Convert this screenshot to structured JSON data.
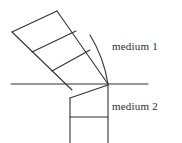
{
  "figure": {
    "kind": "physics-wavefront-refraction-diagram",
    "background_color": "#ffffff",
    "stroke_color": "#333333",
    "text_color": "#2b2b2b",
    "labels": {
      "medium_1": "medium 1",
      "medium_2": "medium 2"
    },
    "geometry": {
      "interface_line": {
        "x1": 11,
        "y1": 84,
        "x2": 148,
        "y2": 84
      },
      "incident_beam_edges": [
        {
          "x1": 12,
          "y1": 32,
          "x2": 72,
          "y2": 90
        },
        {
          "x1": 57,
          "y1": 11,
          "x2": 108,
          "y2": 84
        }
      ],
      "incident_wavefronts": [
        {
          "x1": 12,
          "y1": 32,
          "x2": 57,
          "y2": 11
        },
        {
          "x1": 32,
          "y1": 52,
          "x2": 76,
          "y2": 31
        },
        {
          "x1": 52,
          "y1": 71,
          "x2": 90,
          "y2": 50
        }
      ],
      "curved_wavefront_arc": {
        "start_x": 90,
        "start_y": 35,
        "control_x": 104,
        "control_y": 58,
        "end_x": 108,
        "end_y": 84
      },
      "refracted_beam_edges": [
        {
          "x1": 70,
          "y1": 98,
          "x2": 70,
          "y2": 143
        },
        {
          "x1": 108,
          "y1": 84,
          "x2": 108,
          "y2": 143
        }
      ],
      "refracted_wavefronts": [
        {
          "x1": 70,
          "y1": 98,
          "x2": 108,
          "y2": 85
        },
        {
          "x1": 70,
          "y1": 117,
          "x2": 108,
          "y2": 117
        }
      ]
    }
  }
}
